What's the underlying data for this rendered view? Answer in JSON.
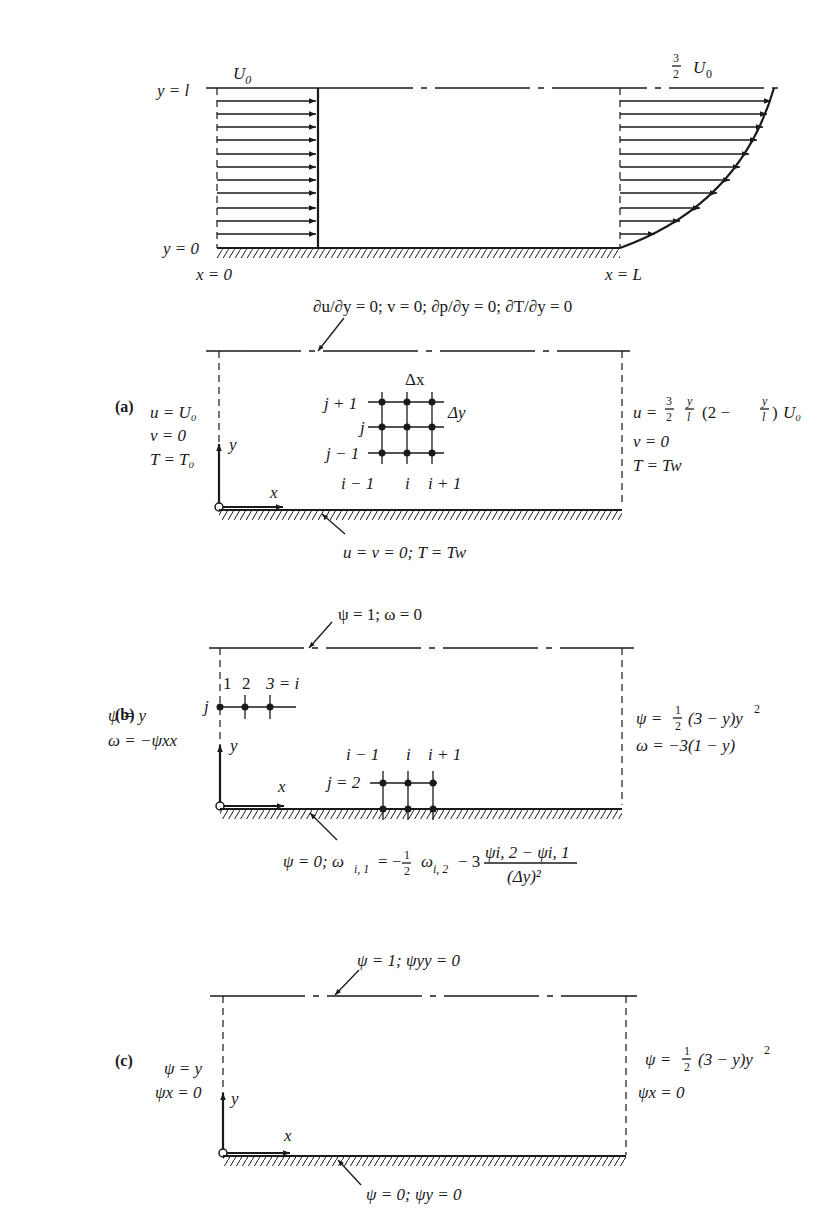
{
  "figure": {
    "top": {
      "inlet_velocity": "U",
      "inlet_velocity_sub": "0",
      "outlet_velocity_frac_num": "3",
      "outlet_velocity_frac_den": "2",
      "outlet_velocity": "U",
      "outlet_velocity_sub": "0",
      "y_top": "y = l",
      "y_bottom": "y = 0",
      "x_inlet": "x = 0",
      "x_outlet": "x = L",
      "inlet_arrow_count": 11,
      "outlet_arrow_count": 11
    },
    "panel_a": {
      "label": "(a)",
      "top_bc": "∂u/∂y = 0; v = 0; ∂p/∂y = 0; ∂T/∂y = 0",
      "inlet_bc": [
        "u = U₀",
        "v = 0",
        "T = T₀"
      ],
      "outlet_bc_u_prefix": "u =",
      "outlet_bc_frac_num": "3",
      "outlet_bc_frac_den": "2",
      "outlet_bc_y": "y",
      "outlet_bc_l": "l",
      "outlet_bc_paren_open": "(2 −",
      "outlet_bc_paren_close": ")",
      "outlet_bc_u0": "U₀",
      "outlet_bc_rest": [
        "v = 0",
        "T = Tw"
      ],
      "wall_bc": "u = v = 0; T = Tw",
      "grid": {
        "dx": "Δx",
        "dy": "Δy",
        "rows": [
          "j + 1",
          "j",
          "j − 1"
        ],
        "cols": [
          "i − 1",
          "i",
          "i + 1"
        ]
      },
      "axis_x": "x",
      "axis_y": "y"
    },
    "panel_b": {
      "label": "(b)",
      "top_bc": "ψ = 1; ω = 0",
      "inlet_bc": [
        "ψ = y",
        "ω = −ψxx"
      ],
      "outlet_bc": [
        "ψ = ½ (3 − y)y²",
        "ω = −3(1 − y)"
      ],
      "outlet_psi_prefix": "ψ =",
      "outlet_psi_frac_num": "1",
      "outlet_psi_frac_den": "2",
      "outlet_psi_rest": "(3 − y)y",
      "outlet_psi_exp": "2",
      "outlet_omega": "ω = −3(1 − y)",
      "wall_bc_prefix": "ψ = 0; ω",
      "wall_bc_sub1": "i, 1",
      "wall_bc_mid": "= −",
      "wall_bc_half_num": "1",
      "wall_bc_half_den": "2",
      "wall_bc_omega2": "ω",
      "wall_bc_sub2": "i, 2",
      "wall_bc_minus3": "− 3",
      "wall_bc_numer": "ψi, 2 − ψi, 1",
      "wall_bc_denom": "(Δy)²",
      "inlet_grid": {
        "row": "j",
        "cols": [
          "1",
          "2",
          "3 = i"
        ]
      },
      "wall_grid": {
        "row": "j = 2",
        "cols": [
          "i − 1",
          "i",
          "i + 1"
        ]
      },
      "axis_x": "x",
      "axis_y": "y"
    },
    "panel_c": {
      "label": "(c)",
      "top_bc": "ψ = 1; ψyy = 0",
      "inlet_bc": [
        "ψ = y",
        "ψx = 0"
      ],
      "outlet_psi_prefix": "ψ =",
      "outlet_psi_frac_num": "1",
      "outlet_psi_frac_den": "2",
      "outlet_psi_rest": "(3 − y)y",
      "outlet_psi_exp": "2",
      "outlet_bc2": "ψx = 0",
      "wall_bc": "ψ = 0; ψy = 0",
      "axis_x": "x",
      "axis_y": "y"
    }
  }
}
